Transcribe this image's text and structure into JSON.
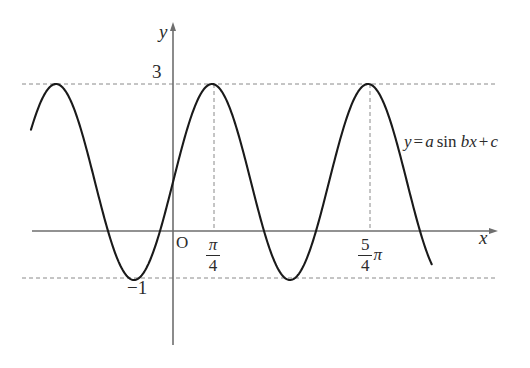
{
  "figure": {
    "kind": "coordinate-plane-sine-graph",
    "background_color": "#ffffff",
    "curve_color": "#1a1a1a",
    "axis_color": "#6e6e6e",
    "guide_color": "#8a8a8a",
    "text_color": "#2b2b2b"
  },
  "axes": {
    "y_axis_label": "y",
    "x_axis_label": "x",
    "origin_label": "O",
    "y_ticks": [
      {
        "label": "3",
        "value": 3
      },
      {
        "label": "−1",
        "value": -1
      }
    ],
    "x_ticks": [
      {
        "numerator": "π",
        "denominator": "4",
        "trailing": "",
        "label": "π/4",
        "value": 0.7853981634
      },
      {
        "numerator": "5",
        "denominator": "4",
        "trailing": "π",
        "label": "5π/4",
        "value": 3.926990817
      }
    ]
  },
  "annotation": {
    "lhs": "y",
    "equals": "=",
    "coef_a": "a",
    "function": "sin",
    "coef_b": "b",
    "variable": "x",
    "plus": "+",
    "constant": "c",
    "full": "y = a sin bx + c"
  },
  "chart_data": {
    "type": "line",
    "title": "",
    "xlabel": "x",
    "ylabel": "y",
    "equation": "y = a sin bx + c",
    "grid": false,
    "legend": "none",
    "guide_lines": [
      {
        "orientation": "horizontal",
        "value": 3,
        "style": "dashed",
        "label": "3"
      },
      {
        "orientation": "horizontal",
        "value": -1,
        "style": "dashed",
        "label": "−1"
      },
      {
        "orientation": "vertical",
        "value": 0.7853981634,
        "style": "dashed",
        "label": "π/4"
      },
      {
        "orientation": "vertical",
        "value": 3.926990817,
        "style": "dashed",
        "label": "5π/4"
      }
    ],
    "fitted_parameters": {
      "a": 2,
      "b": 2,
      "c": 1
    },
    "amplitude": 2,
    "midline": 1,
    "maximum": 3,
    "minimum": -1,
    "period": 3.14159265,
    "maxima_x": [
      -2.3561944,
      0.7853981634,
      3.926990817
    ],
    "minima_x": [
      -0.7853981634,
      2.3561944
    ],
    "xlim": [
      -3.0,
      6.6
    ],
    "ylim": [
      -1.9,
      3.9
    ],
    "x_domain_drawn": [
      -2.86,
      5.21
    ],
    "series": [
      {
        "name": "y = 2 sin 2x + 1",
        "x": [
          -2.86,
          -2.66,
          -2.46,
          -2.26,
          -2.06,
          -1.86,
          -1.66,
          -1.46,
          -1.26,
          -1.06,
          -0.86,
          -0.66,
          -0.46,
          -0.26,
          -0.06,
          0.14,
          0.34,
          0.54,
          0.74,
          0.94,
          1.14,
          1.34,
          1.54,
          1.74,
          1.94,
          2.14,
          2.34,
          2.54,
          2.74,
          2.94,
          3.14,
          3.34,
          3.54,
          3.74,
          3.94,
          4.14,
          4.34,
          4.54,
          4.74,
          4.94,
          5.21
        ],
        "y": [
          1.53,
          2.37,
          2.91,
          2.99,
          2.59,
          1.83,
          0.91,
          0.13,
          -0.31,
          -0.29,
          0.19,
          0.99,
          1.87,
          2.59,
          2.97,
          2.89,
          2.35,
          1.47,
          0.55,
          -0.13,
          -0.41,
          -0.21,
          0.39,
          1.23,
          2.09,
          2.71,
          2.99,
          2.77,
          2.13,
          1.21,
          0.27,
          -0.33,
          -0.39,
          0.07,
          0.83,
          1.71,
          2.47,
          2.93,
          2.95,
          2.51,
          1.35
        ]
      }
    ]
  }
}
